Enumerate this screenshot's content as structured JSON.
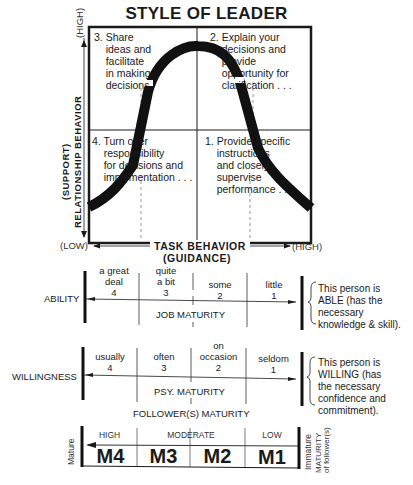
{
  "title": "STYLE OF LEADER",
  "quadrants": {
    "q3": "3. Share\n    ideas and\n    facilitate\n    in making\n    decisions",
    "q2": "2. Explain your\n    decisions and\n    provide\n    opportunity for\n    clarification . . .",
    "q4": "4. Turn over\n    responsibility\n    for decisions and\n    implementation . . .",
    "q1": "1. Provide specific\n    instructions\n    and closely\n    supervise\n    performance . . ."
  },
  "y_axis": {
    "label_line1": "(SUPPORT)",
    "label_line2": "RELATIONSHIP BEHAVIOR",
    "high": "(HIGH)",
    "low": "(LOW)"
  },
  "x_axis": {
    "label_line1": "TASK BEHAVIOR",
    "label_line2": "(GUIDANCE)",
    "low": "(LOW)",
    "high": "(HIGH)"
  },
  "ability": {
    "label": "ABILITY",
    "columns": [
      {
        "text": "a great\ndeal",
        "num": "4"
      },
      {
        "text": "quite\na bit",
        "num": "3"
      },
      {
        "text": "some",
        "num": "2"
      },
      {
        "text": "little",
        "num": "1"
      }
    ],
    "scale_label": "JOB MATURITY",
    "note": "This person is\nABLE (has the\nnecessary\nknowledge & skill)."
  },
  "willingness": {
    "label": "WILLINGNESS",
    "columns": [
      {
        "text": "usually",
        "num": "4"
      },
      {
        "text": "often",
        "num": "3"
      },
      {
        "text": "on\noccasion",
        "num": "2"
      },
      {
        "text": "seldom",
        "num": "1"
      }
    ],
    "scale_label": "PSY. MATURITY",
    "note": "This person is\nWILLING (has\nthe necessary\nconfidence and\ncommitment)."
  },
  "follower_maturity": {
    "title": "FOLLOWER(S) MATURITY",
    "levels": [
      "HIGH",
      "MODERATE",
      "LOW"
    ],
    "codes": [
      "M4",
      "M3",
      "M2",
      "M1"
    ],
    "left_label": "Mature",
    "right_label": "Immature",
    "side_label_line1": "MATURITY",
    "side_label_line2": "of follower(s)"
  },
  "colors": {
    "ink": "#1a1a1a",
    "paper": "#ffffff"
  }
}
